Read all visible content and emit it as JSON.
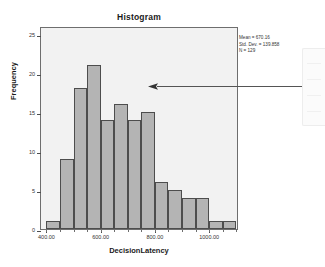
{
  "chart_data": {
    "type": "bar",
    "title": "Histogram",
    "xlabel": "DecisionLatency",
    "ylabel": "Frequency",
    "bin_width": 50,
    "bin_starts": [
      400,
      450,
      500,
      550,
      600,
      650,
      700,
      750,
      800,
      850,
      900,
      950,
      1000,
      1050
    ],
    "categories": [
      "400",
      "450",
      "500",
      "550",
      "600",
      "650",
      "700",
      "750",
      "800",
      "850",
      "900",
      "950",
      "1000",
      "1050"
    ],
    "values": [
      1,
      9,
      18,
      21,
      14,
      16,
      14,
      15,
      6,
      5,
      4,
      4,
      1,
      1
    ],
    "xlim": [
      380,
      1110
    ],
    "ylim": [
      0,
      26
    ],
    "xticks": [
      "400.00",
      "600.00",
      "800.00",
      "1000.00"
    ],
    "xtick_values": [
      400,
      600,
      800,
      1000
    ],
    "yticks": [
      "0",
      "5",
      "10",
      "15",
      "20",
      "25"
    ],
    "ytick_values": [
      0,
      5,
      10,
      15,
      20,
      25
    ],
    "grid": false,
    "legend": "none",
    "bar_fill_color": "#b4b4b4",
    "bar_edge_color": "#4d4d4d",
    "plot_background_color": "#f2f2f2"
  },
  "stats": {
    "mean": "Mean = 670.16",
    "std_dev": "Std. Dev. = 139.858",
    "n": "N = 129"
  },
  "annotation": {
    "arrow_label": "callout-arrow",
    "arrow_color": "#555555"
  }
}
